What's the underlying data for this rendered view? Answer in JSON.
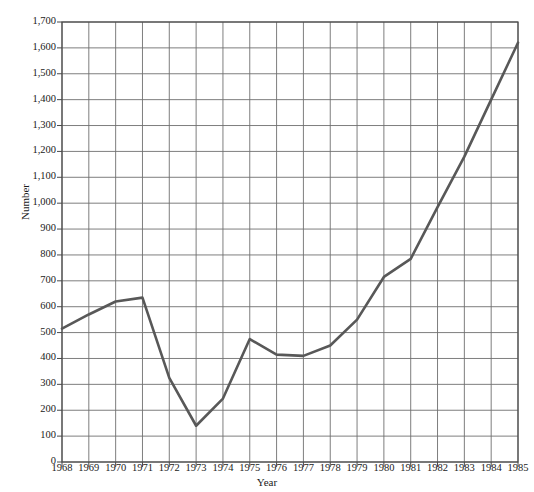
{
  "chart_data": {
    "type": "line",
    "title": "",
    "xlabel": "Year",
    "ylabel": "Number",
    "x": [
      1968,
      1969,
      1970,
      1971,
      1972,
      1973,
      1974,
      1975,
      1976,
      1977,
      1978,
      1979,
      1980,
      1981,
      1982,
      1983,
      1984,
      1985
    ],
    "values": [
      515,
      570,
      620,
      635,
      325,
      140,
      245,
      475,
      415,
      410,
      450,
      550,
      715,
      785,
      985,
      1180,
      1400,
      1620
    ],
    "series": [
      {
        "name": "Number",
        "values": [
          515,
          570,
          620,
          635,
          325,
          140,
          245,
          475,
          415,
          410,
          450,
          550,
          715,
          785,
          985,
          1180,
          1400,
          1620
        ]
      }
    ],
    "xtick_labels": [
      "1968",
      "1969",
      "1970",
      "1971",
      "1972",
      "1973",
      "1974",
      "1975",
      "1976",
      "1977",
      "1978",
      "1979",
      "1980",
      "1981",
      "1982",
      "1983",
      "1984",
      "1985"
    ],
    "ytick_labels": [
      "0",
      "100",
      "200",
      "300",
      "400",
      "500",
      "600",
      "700",
      "800",
      "900",
      "1,000",
      "1,100",
      "1,200",
      "1,300",
      "1,400",
      "1,500",
      "1,600",
      "1,700"
    ],
    "ytick_values": [
      0,
      100,
      200,
      300,
      400,
      500,
      600,
      700,
      800,
      900,
      1000,
      1100,
      1200,
      1300,
      1400,
      1500,
      1600,
      1700
    ],
    "ylim": [
      0,
      1700
    ],
    "xlim": [
      1968,
      1985
    ],
    "grid": true,
    "legend": "none",
    "line_color": "#585858",
    "grid_color": "#6f6f6f",
    "axis_color": "#4a4a4a",
    "background": "#ffffff"
  }
}
